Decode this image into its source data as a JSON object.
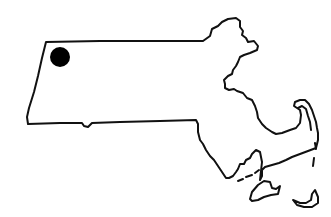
{
  "map": {
    "region": "Massachusetts",
    "style": "line-drawing outline",
    "background_color": "#ffffff",
    "outline_color": "#111111",
    "marker": {
      "shape": "filled-circle",
      "color": "#000000",
      "location_description": "northwest corner (Berkshire region)",
      "cx": 60,
      "cy": 57,
      "r": 10
    }
  }
}
